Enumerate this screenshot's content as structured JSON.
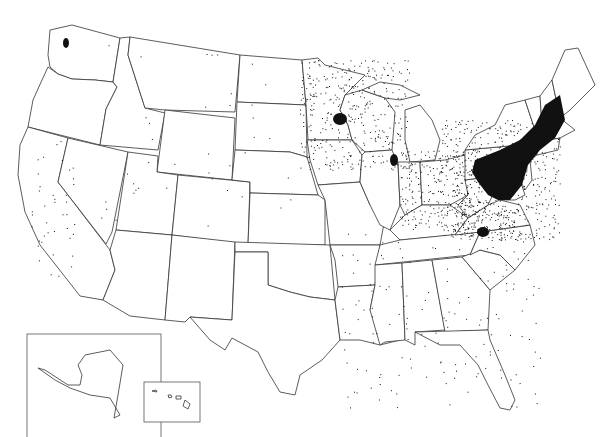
{
  "map": {
    "type": "dot-density",
    "region": "United States",
    "colors": {
      "background": "#ffffff",
      "outline": "#333333",
      "dots": "#111111"
    },
    "insets": [
      {
        "name": "Alaska",
        "frame": [
          27,
          334,
          134,
          104
        ]
      },
      {
        "name": "Hawaii",
        "frame": [
          144,
          382,
          56,
          40
        ]
      }
    ],
    "dense_clusters": [
      {
        "region": "Northeast megalopolis (NY–PA–NJ–New England)",
        "cx": 515,
        "cy": 165,
        "intensity": "very high"
      },
      {
        "region": "Minneapolis area",
        "cx": 340,
        "cy": 119,
        "intensity": "high"
      },
      {
        "region": "Southwest Virginia / West Virginia",
        "cx": 483,
        "cy": 232,
        "intensity": "high"
      },
      {
        "region": "Chicago / SE Wisconsin",
        "cx": 395,
        "cy": 160,
        "intensity": "medium"
      },
      {
        "region": "Puget Sound",
        "cx": 65,
        "cy": 42,
        "intensity": "low"
      }
    ]
  }
}
